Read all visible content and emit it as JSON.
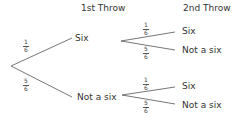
{
  "headers": {
    "first_throw": "1st Throw",
    "second_throw": "2nd Throw"
  },
  "tree": {
    "first": [
      {
        "label": "Six",
        "probability": {
          "num": "1",
          "den": "6"
        }
      },
      {
        "label": "Not a six",
        "probability": {
          "num": "5",
          "den": "6"
        }
      }
    ],
    "second_after_six": [
      {
        "label": "Six",
        "probability": {
          "num": "1",
          "den": "6"
        }
      },
      {
        "label": "Not a six",
        "probability": {
          "num": "5",
          "den": "6"
        }
      }
    ],
    "second_after_not_six": [
      {
        "label": "Six",
        "probability": {
          "num": "1",
          "den": "6"
        }
      },
      {
        "label": "Not a six",
        "probability": {
          "num": "5",
          "den": "6"
        }
      }
    ]
  },
  "colors": {
    "line": "#666666",
    "text": "#333333"
  }
}
